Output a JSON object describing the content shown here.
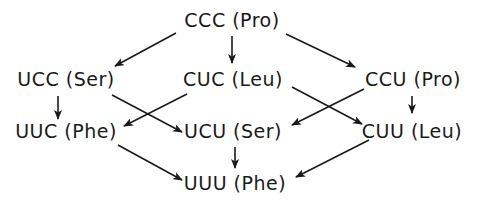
{
  "diagram": {
    "type": "codon mutation lattice",
    "colors": {
      "ink": "#1a1a1a",
      "background": "#ffffff"
    },
    "nodes": [
      {
        "id": "CCC",
        "codon": "CCC",
        "amino_acid": "Pro",
        "label": "CCC (Pro)",
        "x": 232,
        "y": 20
      },
      {
        "id": "UCC",
        "codon": "UCC",
        "amino_acid": "Ser",
        "label": "UCC (Ser)",
        "x": 66,
        "y": 79
      },
      {
        "id": "CUC",
        "codon": "CUC",
        "amino_acid": "Leu",
        "label": "CUC (Leu)",
        "x": 233,
        "y": 79
      },
      {
        "id": "CCU",
        "codon": "CCU",
        "amino_acid": "Pro",
        "label": "CCU (Pro)",
        "x": 413,
        "y": 79
      },
      {
        "id": "UUC",
        "codon": "UUC",
        "amino_acid": "Phe",
        "label": "UUC (Phe)",
        "x": 66,
        "y": 131
      },
      {
        "id": "UCU",
        "codon": "UCU",
        "amino_acid": "Ser",
        "label": "UCU (Ser)",
        "x": 233,
        "y": 131
      },
      {
        "id": "CUU",
        "codon": "CUU",
        "amino_acid": "Leu",
        "label": "CUU (Leu)",
        "x": 412,
        "y": 131
      },
      {
        "id": "UUU",
        "codon": "UUU",
        "amino_acid": "Phe",
        "label": "UUU (Phe)",
        "x": 235,
        "y": 183
      }
    ],
    "edges": [
      {
        "from": "CCC",
        "to": "UCC",
        "x1": 176,
        "y1": 33,
        "x2": 115,
        "y2": 66
      },
      {
        "from": "CCC",
        "to": "CUC",
        "x1": 232,
        "y1": 36,
        "x2": 232,
        "y2": 63
      },
      {
        "from": "CCC",
        "to": "CCU",
        "x1": 286,
        "y1": 34,
        "x2": 355,
        "y2": 67
      },
      {
        "from": "UCC",
        "to": "UUC",
        "x1": 58,
        "y1": 96,
        "x2": 58,
        "y2": 119
      },
      {
        "from": "UCC",
        "to": "UCU",
        "x1": 112,
        "y1": 95,
        "x2": 182,
        "y2": 132
      },
      {
        "from": "CUC",
        "to": "UUC",
        "x1": 187,
        "y1": 94,
        "x2": 124,
        "y2": 126
      },
      {
        "from": "CUC",
        "to": "CUU",
        "x1": 292,
        "y1": 87,
        "x2": 362,
        "y2": 124
      },
      {
        "from": "CCU",
        "to": "UCU",
        "x1": 364,
        "y1": 89,
        "x2": 292,
        "y2": 125
      },
      {
        "from": "CCU",
        "to": "CUU",
        "x1": 412,
        "y1": 96,
        "x2": 412,
        "y2": 113
      },
      {
        "from": "UUC",
        "to": "UUU",
        "x1": 118,
        "y1": 145,
        "x2": 182,
        "y2": 180
      },
      {
        "from": "UCU",
        "to": "UUU",
        "x1": 235,
        "y1": 147,
        "x2": 235,
        "y2": 168
      },
      {
        "from": "CUU",
        "to": "UUU",
        "x1": 369,
        "y1": 140,
        "x2": 296,
        "y2": 177
      }
    ]
  }
}
